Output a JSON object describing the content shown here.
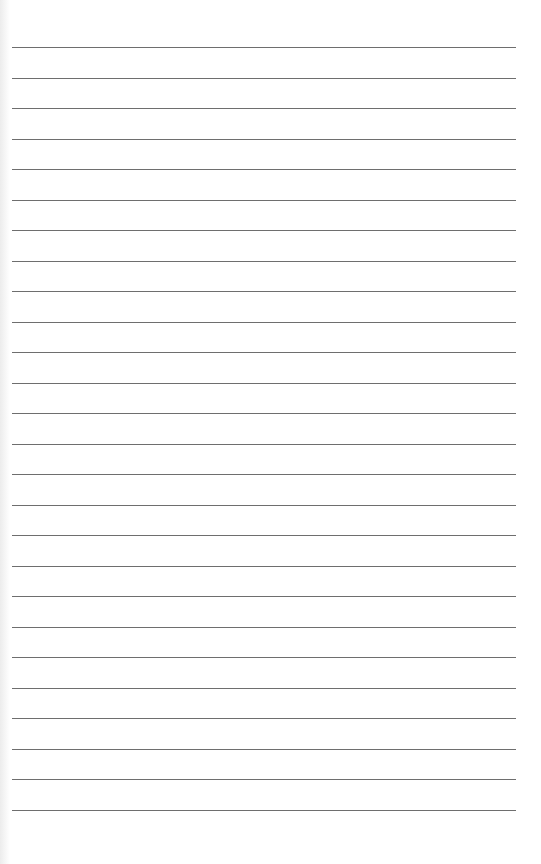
{
  "page": {
    "type": "lined-paper",
    "background_color": "#ffffff",
    "line_color": "#6e6e6e",
    "line_count": 26,
    "first_line_y": 47,
    "line_spacing": 30.5,
    "line_left": 12,
    "line_width": 504
  }
}
